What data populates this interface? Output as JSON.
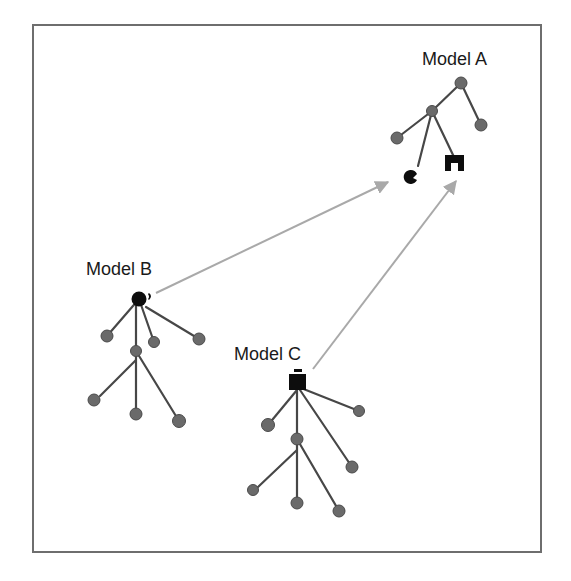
{
  "diagram": {
    "models": [
      {
        "id": "A",
        "label": "Model A"
      },
      {
        "id": "B",
        "label": "Model B"
      },
      {
        "id": "C",
        "label": "Model C"
      }
    ],
    "connections": [
      {
        "from": "Model B",
        "to": "Model A",
        "style": "gray arrow"
      },
      {
        "from": "Model C",
        "to": "Model A",
        "style": "gray arrow"
      }
    ],
    "colors": {
      "frame": "#6e6e6e",
      "edge": "#474747",
      "node": "#6a6a6a",
      "arrow": "#a9a9a9",
      "piece": "#0d0d0d"
    }
  }
}
